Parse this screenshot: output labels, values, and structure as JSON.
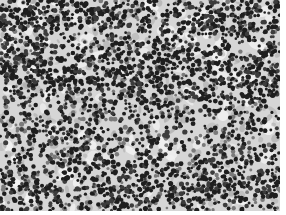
{
  "image": {
    "description": "Grayscale micrograph of densely packed dark round cells on a lighter mottled background",
    "width": 280,
    "height": 211,
    "canvas_size": [
      286,
      215
    ],
    "colors": {
      "page_margin": "#ffffff",
      "background_base": "#d6d6d6",
      "background_light": "#f2f2f2",
      "background_mid": "#a8a8a8",
      "cell_dark": "#1e1e1e",
      "cell_mid": "#3c3c3c",
      "cell_pale": "#7a7a7a"
    },
    "render": {
      "seed": 73,
      "light_patches": 140,
      "gray_blotches": 260,
      "dark_cells": 2600,
      "pale_cells": 500,
      "cell_radius_min": 1.3,
      "cell_radius_max": 2.6,
      "dense_band_rows": [
        0.05,
        0.35,
        0.88
      ]
    }
  }
}
